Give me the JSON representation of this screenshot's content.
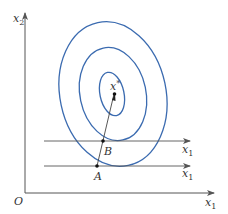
{
  "figure": {
    "origin_label": "O",
    "y_axis_label": "x",
    "y_axis_sub": "2",
    "x_axis_label": "x",
    "x_axis_sub": "1",
    "optimum_label": "x",
    "optimum_sup": "*",
    "point_b_label": "B",
    "point_a_label": "A",
    "line_b_label": "x",
    "line_b_sub": "1",
    "line_a_label": "x",
    "line_a_sub": "1"
  },
  "colors": {
    "contour": "#3b6bb0",
    "axis": "#555555",
    "line": "#444444",
    "point": "#111111"
  }
}
